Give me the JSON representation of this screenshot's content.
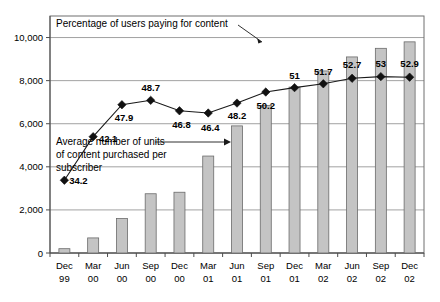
{
  "chart_data": {
    "type": "bar",
    "title": "",
    "subtitle": "",
    "xlabel": "",
    "ylabel": "",
    "grid": true,
    "legend": false,
    "categories": [
      "Dec 99",
      "Mar 00",
      "Jun 00",
      "Sep 00",
      "Dec 00",
      "Mar 01",
      "Jun 01",
      "Sep 01",
      "Dec 01",
      "Mar 02",
      "Jun 02",
      "Sep 02",
      "Dec 02"
    ],
    "category_lines": [
      [
        "Dec",
        "99"
      ],
      [
        "Mar",
        "00"
      ],
      [
        "Jun",
        "00"
      ],
      [
        "Sep",
        "00"
      ],
      [
        "Dec",
        "00"
      ],
      [
        "Mar",
        "01"
      ],
      [
        "Jun",
        "01"
      ],
      [
        "Sep",
        "01"
      ],
      [
        "Dec",
        "01"
      ],
      [
        "Mar",
        "02"
      ],
      [
        "Jun",
        "02"
      ],
      [
        "Sep",
        "02"
      ],
      [
        "Dec",
        "02"
      ]
    ],
    "series": [
      {
        "name": "Average number of units of content purchased per subscriber",
        "type": "bar",
        "axis": "left",
        "values": [
          200,
          700,
          1600,
          2750,
          2820,
          4500,
          5900,
          6850,
          7700,
          8450,
          9100,
          9500,
          9800
        ]
      },
      {
        "name": "Percentage of users paying for content",
        "type": "line",
        "axis": "right",
        "values": [
          34.2,
          42.1,
          47.9,
          48.7,
          46.8,
          46.4,
          48.2,
          50.2,
          51,
          51.7,
          52.7,
          53,
          52.9
        ],
        "labels": [
          "34.2",
          "42.1",
          "47.9",
          "48.7",
          "46.8",
          "46.4",
          "48.2",
          "50.2",
          "51",
          "51.7",
          "52.7",
          "53",
          "52.9"
        ],
        "marker": "diamond"
      }
    ],
    "yaxis_left": {
      "ticks": [
        0,
        2000,
        4000,
        6000,
        8000,
        10000
      ],
      "tick_labels": [
        "0",
        "2,000",
        "4,000",
        "6,000",
        "8,000",
        "10,000"
      ],
      "ylim": [
        0,
        11000
      ]
    },
    "annotations": [
      {
        "id": "percentage-callout",
        "lines": [
          "Percentage of users paying for content"
        ],
        "points_to": "Sep 01"
      },
      {
        "id": "units-callout",
        "lines": [
          "Average number of units",
          "of content purchased per",
          "subscriber"
        ],
        "points_to": "Mar 01"
      }
    ],
    "colors": {
      "bar_fill": "#c4c4c4",
      "bar_stroke": "#6b6b6b",
      "line": "#1a1a1a",
      "marker": "#111111",
      "grid": "#8a8a8a",
      "text": "#000000",
      "background": "#ffffff"
    }
  }
}
